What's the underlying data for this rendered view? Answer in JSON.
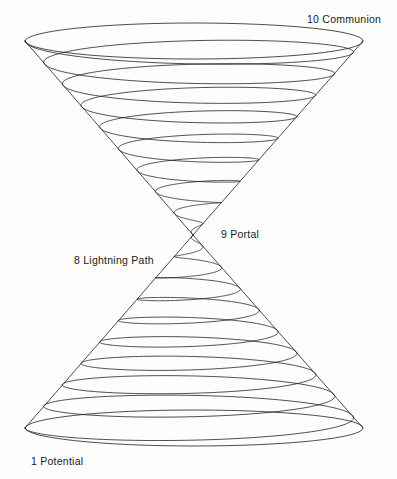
{
  "figure": {
    "background_color": "#fdfdfc",
    "line_color": "#1f1f1f",
    "text_color": "#1b1b1b",
    "line_width": 0.8,
    "width": 397,
    "height": 479
  },
  "labels": [
    {
      "id": "communion",
      "number": "10",
      "name": "Communion",
      "text": "10  Communion",
      "x": 307,
      "y": 14
    },
    {
      "id": "portal",
      "number": "9",
      "name": "Portal",
      "text": "9  Portal",
      "x": 221,
      "y": 229
    },
    {
      "id": "lightning",
      "number": "8",
      "name": "Lightning Path",
      "text": "8  Lightning Path",
      "x": 74,
      "y": 255
    },
    {
      "id": "potential",
      "number": "1",
      "name": "Potential",
      "text": "1  Potential",
      "x": 31,
      "y": 456
    }
  ],
  "geometry": {
    "apex": {
      "x": 193,
      "y": 235
    },
    "upper_cone": {
      "rim_y": 41,
      "rim_left_x": 25,
      "rim_right_x": 364,
      "rim_center_x": 194,
      "rim_radius_x": 169,
      "rim_radius_y": 18,
      "turns": 9,
      "direction": "clockwise-from-apex"
    },
    "lower_cone": {
      "rim_y": 428,
      "rim_left_x": 25,
      "rim_right_x": 364,
      "rim_center_x": 194,
      "rim_radius_x": 169,
      "rim_radius_y": 18,
      "turns": 9,
      "direction": "clockwise-from-apex"
    }
  }
}
